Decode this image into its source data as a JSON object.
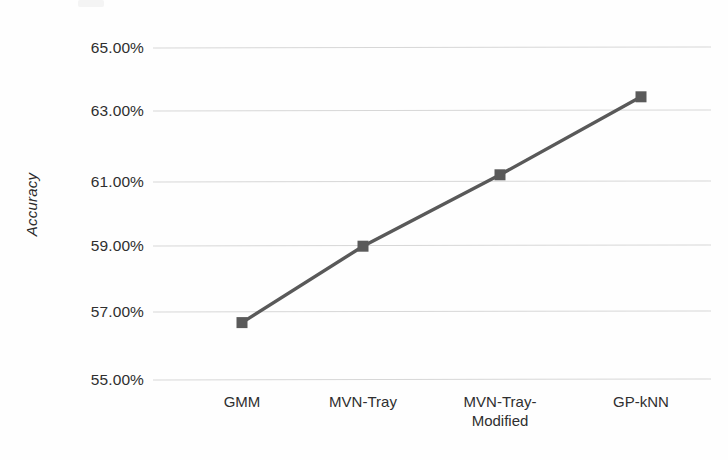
{
  "chart_data": {
    "type": "line",
    "title": "",
    "subtitle": "",
    "xlabel": "",
    "ylabel": "Accuracy",
    "categories": [
      "GMM",
      "MVN-Tray",
      "MVN-Tray-\nModified",
      "GP-kNN"
    ],
    "category_labels": [
      {
        "line1": "GMM",
        "line2": ""
      },
      {
        "line1": "MVN-Tray",
        "line2": ""
      },
      {
        "line1": "MVN-Tray-",
        "line2": "Modified"
      },
      {
        "line1": "GP-kNN",
        "line2": ""
      }
    ],
    "values": [
      56.7,
      59.0,
      61.15,
      63.5
    ],
    "value_labels": [
      "56.70%",
      "59.00%",
      "61.15%",
      "63.50%"
    ],
    "ylim": [
      55.0,
      65.0
    ],
    "ytick_values": [
      65.0,
      63.0,
      61.0,
      59.0,
      57.0,
      55.0
    ],
    "ytick_labels": [
      "65.00%",
      "63.00%",
      "61.00%",
      "59.00%",
      "57.00%",
      "55.00%"
    ],
    "grid": true,
    "grid_axis": "y",
    "legend": false,
    "legend_position": "none",
    "marker": "square",
    "series": [
      {
        "name": "Accuracy",
        "values": [
          56.7,
          59.0,
          61.15,
          63.5
        ]
      }
    ],
    "colors": {
      "line": "#595959",
      "marker": "#5a5a5a",
      "gridline": "#d7d7d7",
      "text": "#2f2f2f",
      "background": "#ffffff"
    }
  }
}
